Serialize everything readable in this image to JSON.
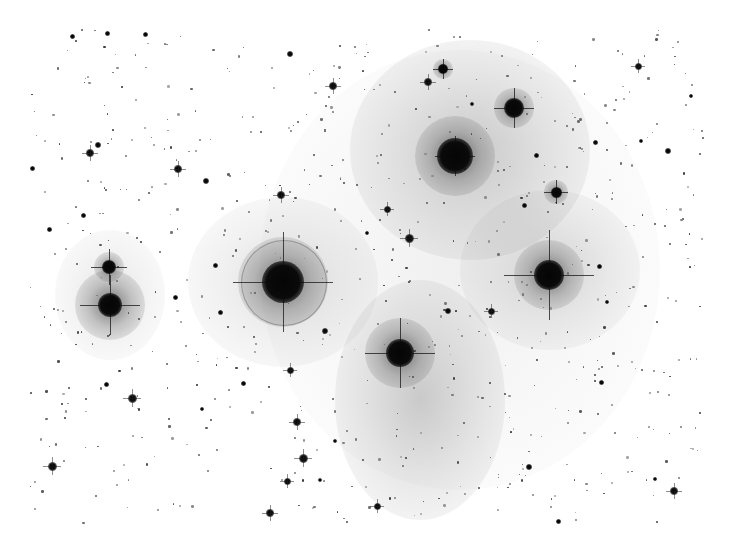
{
  "image": {
    "subject": "Inverted (negative) astrophotograph of an open star cluster with reflection nebulosity",
    "width": 732,
    "height": 557,
    "background": "#ffffff",
    "field_bounds": {
      "left": 30,
      "top": 28,
      "right": 705,
      "bottom": 525
    }
  },
  "nebulae": [
    {
      "x": 470,
      "y": 150,
      "rx": 120,
      "ry": 110,
      "opacity": 0.22
    },
    {
      "x": 550,
      "y": 270,
      "rx": 90,
      "ry": 80,
      "opacity": 0.16
    },
    {
      "x": 420,
      "y": 400,
      "rx": 85,
      "ry": 120,
      "opacity": 0.22
    },
    {
      "x": 283,
      "y": 282,
      "rx": 95,
      "ry": 85,
      "opacity": 0.14
    },
    {
      "x": 110,
      "y": 295,
      "rx": 55,
      "ry": 65,
      "opacity": 0.12
    },
    {
      "x": 460,
      "y": 270,
      "rx": 200,
      "ry": 220,
      "opacity": 0.07
    }
  ],
  "bright_stars": [
    {
      "name": "alcyone",
      "x": 283,
      "y": 282,
      "core": 42,
      "halo": 90,
      "ring": 84,
      "spike": 100
    },
    {
      "name": "atlas",
      "x": 110,
      "y": 305,
      "core": 24,
      "halo": 70,
      "ring": 0,
      "spike": 60
    },
    {
      "name": "pleione",
      "x": 109,
      "y": 267,
      "core": 14,
      "halo": 30,
      "ring": 0,
      "spike": 36
    },
    {
      "name": "electra",
      "x": 455,
      "y": 156,
      "core": 36,
      "halo": 80,
      "ring": 0,
      "spike": 40
    },
    {
      "name": "maia",
      "x": 549,
      "y": 275,
      "core": 30,
      "halo": 70,
      "ring": 0,
      "spike": 90
    },
    {
      "name": "merope",
      "x": 400,
      "y": 353,
      "core": 28,
      "halo": 70,
      "ring": 0,
      "spike": 70
    },
    {
      "name": "taygeta",
      "x": 514,
      "y": 108,
      "core": 20,
      "halo": 40,
      "ring": 0,
      "spike": 40
    },
    {
      "name": "celaeno",
      "x": 443,
      "y": 69,
      "core": 10,
      "halo": 20,
      "ring": 0,
      "spike": 20
    },
    {
      "name": "asterope",
      "x": 556,
      "y": 192,
      "core": 11,
      "halo": 24,
      "ring": 0,
      "spike": 24
    }
  ],
  "stars": [
    {
      "x": 428,
      "y": 82,
      "s": 8
    },
    {
      "x": 333,
      "y": 86,
      "s": 8
    },
    {
      "x": 90,
      "y": 153,
      "s": 8
    },
    {
      "x": 98,
      "y": 145,
      "s": 6
    },
    {
      "x": 178,
      "y": 169,
      "s": 8
    },
    {
      "x": 206,
      "y": 181,
      "s": 6
    },
    {
      "x": 281,
      "y": 195,
      "s": 8
    },
    {
      "x": 387,
      "y": 209,
      "s": 7
    },
    {
      "x": 409,
      "y": 238,
      "s": 9
    },
    {
      "x": 32,
      "y": 168,
      "s": 5
    },
    {
      "x": 83,
      "y": 215,
      "s": 5
    },
    {
      "x": 49,
      "y": 229,
      "s": 5
    },
    {
      "x": 290,
      "y": 54,
      "s": 6
    },
    {
      "x": 638,
      "y": 66,
      "s": 7
    },
    {
      "x": 668,
      "y": 151,
      "s": 6
    },
    {
      "x": 595,
      "y": 142,
      "s": 5
    },
    {
      "x": 536,
      "y": 155,
      "s": 5
    },
    {
      "x": 599,
      "y": 266,
      "s": 5
    },
    {
      "x": 491,
      "y": 311,
      "s": 7
    },
    {
      "x": 448,
      "y": 311,
      "s": 6
    },
    {
      "x": 325,
      "y": 331,
      "s": 6
    },
    {
      "x": 290,
      "y": 370,
      "s": 7
    },
    {
      "x": 132,
      "y": 398,
      "s": 9
    },
    {
      "x": 106,
      "y": 384,
      "s": 5
    },
    {
      "x": 297,
      "y": 422,
      "s": 8
    },
    {
      "x": 303,
      "y": 458,
      "s": 9
    },
    {
      "x": 287,
      "y": 481,
      "s": 7
    },
    {
      "x": 270,
      "y": 513,
      "s": 8
    },
    {
      "x": 52,
      "y": 466,
      "s": 9
    },
    {
      "x": 243,
      "y": 383,
      "s": 5
    },
    {
      "x": 377,
      "y": 506,
      "s": 7
    },
    {
      "x": 529,
      "y": 467,
      "s": 6
    },
    {
      "x": 674,
      "y": 491,
      "s": 8
    },
    {
      "x": 601,
      "y": 382,
      "s": 5
    },
    {
      "x": 655,
      "y": 479,
      "s": 4
    },
    {
      "x": 558,
      "y": 521,
      "s": 5
    },
    {
      "x": 72,
      "y": 36,
      "s": 5
    },
    {
      "x": 107,
      "y": 33,
      "s": 5
    },
    {
      "x": 145,
      "y": 34,
      "s": 5
    },
    {
      "x": 215,
      "y": 265,
      "s": 5
    },
    {
      "x": 175,
      "y": 297,
      "s": 5
    },
    {
      "x": 220,
      "y": 312,
      "s": 5
    },
    {
      "x": 691,
      "y": 96,
      "s": 4
    },
    {
      "x": 472,
      "y": 104,
      "s": 4
    },
    {
      "x": 641,
      "y": 141,
      "s": 4
    },
    {
      "x": 524,
      "y": 205,
      "s": 5
    },
    {
      "x": 607,
      "y": 302,
      "s": 4
    },
    {
      "x": 367,
      "y": 233,
      "s": 4
    },
    {
      "x": 202,
      "y": 409,
      "s": 4
    },
    {
      "x": 335,
      "y": 441,
      "s": 4
    },
    {
      "x": 320,
      "y": 480,
      "s": 4
    }
  ],
  "faint_star_count": 650,
  "faint_star_seed": 7
}
